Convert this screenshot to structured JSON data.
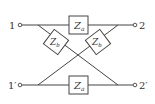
{
  "diagram": {
    "type": "lattice-network",
    "terminals": {
      "in_top": "1",
      "in_bottom": "1′",
      "out_top": "2",
      "out_bottom": "2′"
    },
    "impedances": {
      "series_top": {
        "main": "Z",
        "sub": "a"
      },
      "series_bottom": {
        "main": "Z",
        "sub": "a"
      },
      "cross_left": {
        "main": "Z",
        "sub": "b"
      },
      "cross_right": {
        "main": "Z",
        "sub": "b"
      }
    },
    "colors": {
      "line": "#444444",
      "background": "#ffffff"
    }
  }
}
